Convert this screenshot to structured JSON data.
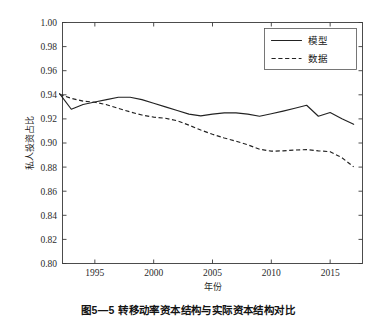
{
  "figure": {
    "caption": "图5—5  转移动率资本结构与实际资本结构对比"
  },
  "chart_data": {
    "type": "line",
    "title": "",
    "xlabel": "年份",
    "ylabel": "私人投资占比",
    "xlim": [
      1992.25,
      2017.75
    ],
    "ylim": [
      0.8,
      1.0
    ],
    "grid": false,
    "legend_position": "top-right",
    "yticks": [
      0.8,
      0.82,
      0.84,
      0.86,
      0.88,
      0.9,
      0.92,
      0.94,
      0.96,
      0.98,
      1.0
    ],
    "ytick_labels": [
      "0.80",
      "0.82",
      "0.84",
      "0.86",
      "0.88",
      "0.90",
      "0.92",
      "0.94",
      "0.96",
      "0.98",
      "1.00"
    ],
    "xticks": [
      1995,
      2000,
      2005,
      2010,
      2015
    ],
    "xtick_labels": [
      "1995",
      "2000",
      "2005",
      "2010",
      "2015"
    ],
    "x": [
      1992,
      1993,
      1994,
      1995,
      1996,
      1997,
      1998,
      1999,
      2000,
      2001,
      2002,
      2003,
      2004,
      2005,
      2006,
      2007,
      2008,
      2009,
      2010,
      2011,
      2012,
      2013,
      2014,
      2015,
      2016,
      2017
    ],
    "series": [
      {
        "name": "模型",
        "style": "solid",
        "color": "#222222",
        "values": [
          0.941,
          0.928,
          0.932,
          0.934,
          0.936,
          0.938,
          0.938,
          0.936,
          0.933,
          0.93,
          0.927,
          0.924,
          0.9225,
          0.924,
          0.925,
          0.925,
          0.924,
          0.9222,
          0.9243,
          0.9265,
          0.9288,
          0.9313,
          0.9222,
          0.9253,
          0.9202,
          0.9155
        ]
      },
      {
        "name": "数据",
        "style": "dashed",
        "color": "#222222",
        "values": [
          0.9405,
          0.937,
          0.9348,
          0.9338,
          0.9318,
          0.9288,
          0.9258,
          0.9232,
          0.9215,
          0.9205,
          0.9185,
          0.9148,
          0.9108,
          0.9072,
          0.9042,
          0.9015,
          0.8985,
          0.8948,
          0.8932,
          0.8935,
          0.8942,
          0.8945,
          0.8935,
          0.8928,
          0.8878,
          0.8802
        ]
      }
    ]
  }
}
